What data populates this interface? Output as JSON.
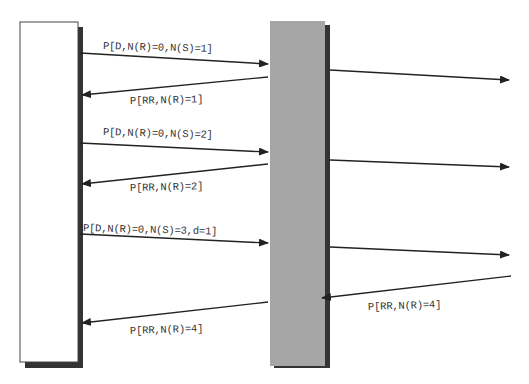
{
  "diagram": {
    "type": "sequence",
    "colors": {
      "line": "#222222",
      "left_box_fill": "#ffffff",
      "left_box_border": "#444444",
      "shadow": "#333333",
      "middle_bar_fill": "#a6a6a6"
    },
    "lifelines": [
      {
        "id": "left-station",
        "label": ""
      },
      {
        "id": "middle-node",
        "label": ""
      },
      {
        "id": "right-off-screen",
        "label": ""
      }
    ],
    "messages": [
      {
        "from": "left-station",
        "to": "middle-node",
        "label": "P[D,N(R)=0,N(S)=1]"
      },
      {
        "from": "middle-node",
        "to": "left-station",
        "label": "P[RR,N(R)=1]"
      },
      {
        "from": "middle-node",
        "to": "right-off-screen",
        "label": ""
      },
      {
        "from": "left-station",
        "to": "middle-node",
        "label": "P[D,N(R)=0,N(S)=2]"
      },
      {
        "from": "middle-node",
        "to": "left-station",
        "label": "P[RR,N(R)=2]"
      },
      {
        "from": "middle-node",
        "to": "right-off-screen",
        "label": ""
      },
      {
        "from": "left-station",
        "to": "middle-node",
        "label": "P[D,N(R)=0,N(S)=3,d=1]"
      },
      {
        "from": "middle-node",
        "to": "right-off-screen",
        "label": ""
      },
      {
        "from": "right-off-screen",
        "to": "middle-node",
        "label": "P[RR,N(R)=4]"
      },
      {
        "from": "middle-node",
        "to": "left-station",
        "label": "P[RR,N(R)=4]"
      }
    ]
  }
}
